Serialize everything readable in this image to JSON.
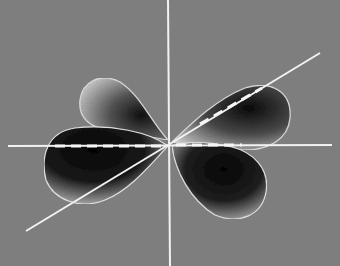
{
  "figure": {
    "background_color": "#7e7e7e",
    "axis_color": "#f2f2f2",
    "lobe_dark_color": "#0d0d0d",
    "lobe_light_color": "#d8d8d8",
    "axes": [
      {
        "name": "vertical-axis",
        "x1": 168,
        "y1": 0,
        "x2": 170,
        "y2": 266
      },
      {
        "name": "horizontal-axis",
        "x1": 8,
        "y1": 146,
        "x2": 332,
        "y2": 145
      },
      {
        "name": "diagonal-axis",
        "x1": 26,
        "y1": 231,
        "x2": 320,
        "y2": 53
      }
    ],
    "dashed_lines": [
      {
        "name": "dashed-left",
        "x1": 55,
        "y1": 146,
        "x2": 165,
        "y2": 146
      },
      {
        "name": "dashed-right",
        "x1": 176,
        "y1": 145,
        "x2": 242,
        "y2": 145
      },
      {
        "name": "dashed-diagonal",
        "x1": 200,
        "y1": 124,
        "x2": 262,
        "y2": 88
      }
    ]
  }
}
